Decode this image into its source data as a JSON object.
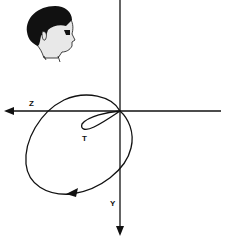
{
  "diagram": {
    "type": "vectorcardiogram-loop",
    "axes": {
      "horizontal": {
        "label": "Z",
        "direction": "left"
      },
      "vertical": {
        "label": "Y",
        "direction": "down"
      }
    },
    "loops": [
      {
        "name": "QRS loop",
        "label": "",
        "direction_arrow": "counter-clockwise"
      },
      {
        "name": "T loop",
        "label": "T"
      }
    ],
    "orientation_icon": "head-profile-facing-right",
    "colors": {
      "line": "#111111",
      "background": "#ffffff"
    }
  }
}
